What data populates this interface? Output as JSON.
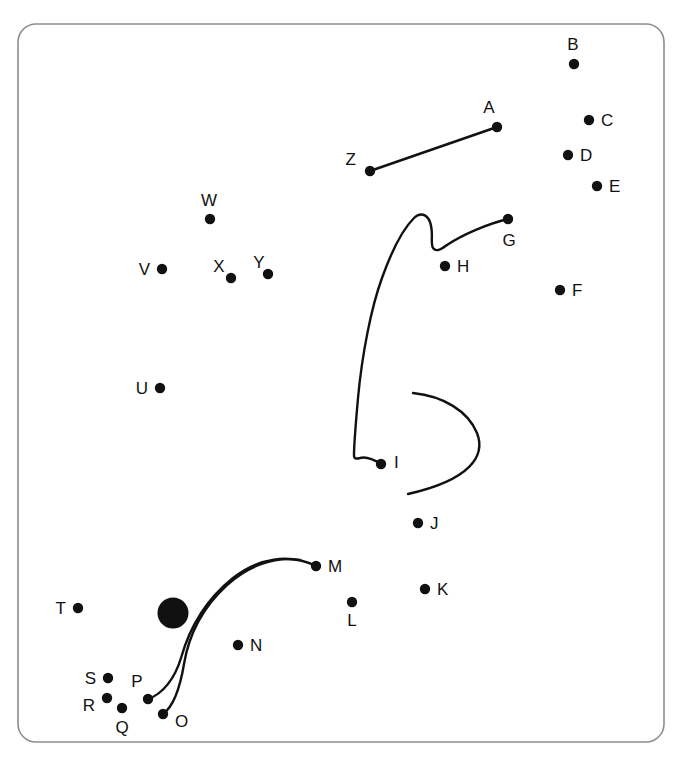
{
  "canvas": {
    "width": 682,
    "height": 760,
    "background": "#ffffff",
    "top_text_remnant": "",
    "frame": {
      "name": "rounded-panel-border",
      "x": 18,
      "y": 24,
      "width": 646,
      "height": 718,
      "radius": 18,
      "stroke": "#8d8d8d",
      "stroke_width": 1.6,
      "fill": "#ffffff"
    },
    "ink_color": "#111111",
    "dot_radius": 5.2,
    "stroke_width": 2.4
  },
  "nodes": [
    {
      "id": "A",
      "label": "A",
      "cx": 497,
      "cy": 127,
      "label_x": 489,
      "label_y": 113,
      "label_anchor": "middle"
    },
    {
      "id": "B",
      "label": "B",
      "cx": 574,
      "cy": 64,
      "label_x": 573,
      "label_y": 50,
      "label_anchor": "middle"
    },
    {
      "id": "C",
      "label": "C",
      "cx": 589,
      "cy": 120,
      "label_x": 601,
      "label_y": 126,
      "label_anchor": "start"
    },
    {
      "id": "D",
      "label": "D",
      "cx": 568,
      "cy": 155,
      "label_x": 580,
      "label_y": 161,
      "label_anchor": "start"
    },
    {
      "id": "E",
      "label": "E",
      "cx": 597,
      "cy": 186,
      "label_x": 609,
      "label_y": 192,
      "label_anchor": "start"
    },
    {
      "id": "F",
      "label": "F",
      "cx": 560,
      "cy": 290,
      "label_x": 572,
      "label_y": 296,
      "label_anchor": "start"
    },
    {
      "id": "G",
      "label": "G",
      "cx": 508,
      "cy": 219,
      "label_x": 509,
      "label_y": 246,
      "label_anchor": "middle"
    },
    {
      "id": "H",
      "label": "H",
      "cx": 445,
      "cy": 266,
      "label_x": 457,
      "label_y": 272,
      "label_anchor": "start"
    },
    {
      "id": "I",
      "label": "I",
      "cx": 381,
      "cy": 464,
      "label_x": 394,
      "label_y": 468,
      "label_anchor": "start"
    },
    {
      "id": "J",
      "label": "J",
      "cx": 418,
      "cy": 523,
      "label_x": 430,
      "label_y": 529,
      "label_anchor": "start"
    },
    {
      "id": "K",
      "label": "K",
      "cx": 425,
      "cy": 589,
      "label_x": 437,
      "label_y": 595,
      "label_anchor": "start"
    },
    {
      "id": "L",
      "label": "L",
      "cx": 352,
      "cy": 602,
      "label_x": 352,
      "label_y": 626,
      "label_anchor": "middle"
    },
    {
      "id": "M",
      "label": "M",
      "cx": 316,
      "cy": 566,
      "label_x": 328,
      "label_y": 572,
      "label_anchor": "start"
    },
    {
      "id": "N",
      "label": "N",
      "cx": 238,
      "cy": 645,
      "label_x": 250,
      "label_y": 651,
      "label_anchor": "start"
    },
    {
      "id": "O",
      "label": "O",
      "cx": 163,
      "cy": 714,
      "label_x": 175,
      "label_y": 727,
      "label_anchor": "start"
    },
    {
      "id": "P",
      "label": "P",
      "cx": 148,
      "cy": 699,
      "label_x": 137,
      "label_y": 687,
      "label_anchor": "middle"
    },
    {
      "id": "Q",
      "label": "Q",
      "cx": 122,
      "cy": 708,
      "label_x": 122,
      "label_y": 733,
      "label_anchor": "middle"
    },
    {
      "id": "R",
      "label": "R",
      "cx": 107,
      "cy": 698,
      "label_x": 95,
      "label_y": 711,
      "label_anchor": "end"
    },
    {
      "id": "S",
      "label": "S",
      "cx": 108,
      "cy": 678,
      "label_x": 96,
      "label_y": 684,
      "label_anchor": "end"
    },
    {
      "id": "T",
      "label": "T",
      "cx": 78,
      "cy": 608,
      "label_x": 66,
      "label_y": 614,
      "label_anchor": "end"
    },
    {
      "id": "U",
      "label": "U",
      "cx": 160,
      "cy": 388,
      "label_x": 148,
      "label_y": 394,
      "label_anchor": "end"
    },
    {
      "id": "V",
      "label": "V",
      "cx": 162,
      "cy": 269,
      "label_x": 150,
      "label_y": 275,
      "label_anchor": "end"
    },
    {
      "id": "W",
      "label": "W",
      "cx": 210,
      "cy": 219,
      "label_x": 209,
      "label_y": 206,
      "label_anchor": "middle"
    },
    {
      "id": "X",
      "label": "X",
      "cx": 231,
      "cy": 278,
      "label_x": 219,
      "label_y": 272,
      "label_anchor": "middle"
    },
    {
      "id": "Y",
      "label": "Y",
      "cx": 268,
      "cy": 274,
      "label_x": 259,
      "label_y": 268,
      "label_anchor": "middle"
    },
    {
      "id": "Z",
      "label": "Z",
      "cx": 370,
      "cy": 171,
      "label_x": 356,
      "label_y": 165,
      "label_anchor": "end"
    }
  ],
  "blob": {
    "name": "large-filled-circle",
    "cx": 173,
    "cy": 613,
    "r": 15.5,
    "fill": "#111111"
  },
  "strokes": [
    {
      "name": "line-z-to-a",
      "kind": "line",
      "endpoints": [
        "Z",
        "A"
      ],
      "d": "M 370 171 L 497 127"
    },
    {
      "name": "curve-g-to-i",
      "kind": "curve",
      "endpoints": [
        "G",
        "I"
      ],
      "d": "M 508 219 C 487 224 462 235 447 245 C 440 250 436 252 433 248 C 430 243 434 233 430 222 C 427 214 420 212 414 218 C 404 228 392 250 382 278 C 371 308 362 355 358 398 C 355 432 354 450 354 455 C 354 459 356 459 360 458 C 366 456 373 459 381 464"
    },
    {
      "name": "arc-c-shape",
      "kind": "curve",
      "endpoints": [],
      "d": "M 413 393 C 443 396 468 411 477 433 C 486 456 470 480 408 494"
    },
    {
      "name": "curve-m-to-p",
      "kind": "curve",
      "endpoints": [
        "M",
        "P"
      ],
      "d": "M 316 566 C 289 553 258 558 233 578 C 208 598 190 626 181 658 C 175 678 163 694 148 699"
    },
    {
      "name": "curve-m-to-o",
      "kind": "curve",
      "endpoints": [
        "M",
        "O"
      ],
      "d": "M 300 560 C 274 556 248 566 227 585 C 204 606 189 634 184 664 C 180 688 174 706 163 714"
    }
  ],
  "legend": {
    "description": "Labeled point set A-Z with connecting line and curve strokes"
  }
}
